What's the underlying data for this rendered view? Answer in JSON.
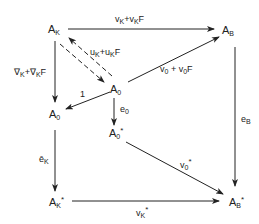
{
  "nodes": {
    "AK": {
      "base": "A",
      "sub": "K",
      "sup": ""
    },
    "AB": {
      "base": "A",
      "sub": "B",
      "sup": ""
    },
    "A0c": {
      "base": "A",
      "sub": "0",
      "sup": ""
    },
    "A0l": {
      "base": "A",
      "sub": "0",
      "sup": ""
    },
    "A0s": {
      "base": "A",
      "sub": "0",
      "sup": "*"
    },
    "AKs": {
      "base": "A",
      "sub": "K",
      "sup": "*"
    },
    "ABs": {
      "base": "A",
      "sub": "B",
      "sup": "*"
    }
  },
  "arrows": {
    "top": {
      "from": "A_K",
      "to": "A_B",
      "label": "v_K+v_KF"
    },
    "dash_down": {
      "from": "A_K",
      "to": "A_0",
      "style": "dashed"
    },
    "dash_up": {
      "from": "A_0",
      "to": "A_K",
      "label": "u_K+u_KF",
      "style": "dashed"
    },
    "left": {
      "from": "A_K",
      "to": "A_0",
      "label": "∇_K+∇_KF"
    },
    "one": {
      "from": "A_0",
      "to": "A_0 (left)",
      "label": "1"
    },
    "diag_up": {
      "from": "A_0",
      "to": "A_B",
      "label": "v_0+v_0F"
    },
    "e0": {
      "from": "A_0",
      "to": "A_0*",
      "label": "e_0"
    },
    "eB": {
      "from": "A_B",
      "to": "A_B*",
      "label": "e_B"
    },
    "ebarK": {
      "from": "A_0 (left)",
      "to": "A_K*",
      "label": "ē_K"
    },
    "v0s": {
      "from": "A_0*",
      "to": "A_B*",
      "label": "v_0*"
    },
    "vKs": {
      "from": "A_K*",
      "to": "A_B*",
      "label": "v_K*"
    }
  },
  "labels": {
    "top": {
      "a": "v",
      "as": "K",
      "b": "+v",
      "bs": "K",
      "c": "F"
    },
    "uK": {
      "a": "u",
      "as": "K",
      "b": "+u",
      "bs": "K",
      "c": "F"
    },
    "nabla": {
      "a": "∇",
      "as": "K",
      "b": "+∇",
      "bs": "K",
      "c": "F"
    },
    "one": "1",
    "v0": {
      "a": "v",
      "as": "0",
      "b": " + v",
      "bs": "0",
      "c": "F"
    },
    "e0": {
      "a": "e",
      "as": "0"
    },
    "eB": {
      "a": "e",
      "as": "B"
    },
    "ebarK": {
      "a": "ē",
      "as": "K"
    },
    "v0s": {
      "a": "v",
      "as": "0",
      "sup": "*"
    },
    "vKs": {
      "a": "v",
      "as": "K",
      "sup": "*"
    }
  }
}
